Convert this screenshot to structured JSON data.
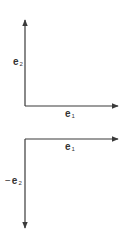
{
  "colors": {
    "axis": "#3a3a3a",
    "label": "#333333",
    "background": "#ffffff"
  },
  "diagrams": [
    {
      "name": "top-basis",
      "vectors": [
        {
          "label_base": "e",
          "label_sub": "2",
          "prefix": "",
          "direction": "up"
        },
        {
          "label_base": "e",
          "label_sub": "1",
          "prefix": "",
          "direction": "right"
        }
      ]
    },
    {
      "name": "bottom-basis",
      "vectors": [
        {
          "label_base": "e",
          "label_sub": "1",
          "prefix": "",
          "direction": "right"
        },
        {
          "label_base": "e",
          "label_sub": "2",
          "prefix": "−",
          "direction": "down"
        }
      ]
    }
  ]
}
